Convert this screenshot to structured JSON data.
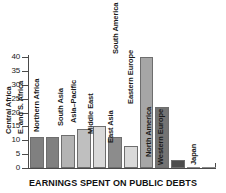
{
  "chart_data": {
    "type": "bar",
    "title": "EARNINGS SPENT ON PUBLIC DEBTS",
    "xlabel": "",
    "ylabel": "",
    "ylim": [
      0,
      40
    ],
    "yticks": [
      0,
      5,
      10,
      15,
      20,
      25,
      30,
      35,
      40
    ],
    "grid": false,
    "legend": "none",
    "categories": [
      "Central Africa",
      "E. and S. Africa",
      "Northern Africa",
      "South Asia",
      "Asia–Pacific",
      "Middle East",
      "East Asia",
      "South America",
      "Eastern Europe",
      "North America",
      "Western Europe",
      "Japan"
    ],
    "values": [
      11,
      11,
      12,
      14,
      15,
      11,
      8,
      40,
      22,
      3,
      0,
      0
    ],
    "bar_colors": [
      "#808080",
      "#808080",
      "#b3b3b3",
      "#bfbfbf",
      "#d9d9d9",
      "#8c8c8c",
      "#d9d9d9",
      "#a6a6a6",
      "#737373",
      "#4d4d4d",
      "#ffffff",
      "#ffffff"
    ],
    "axis_color": "#4a4a4a",
    "text_color": "#1a1a1a"
  }
}
